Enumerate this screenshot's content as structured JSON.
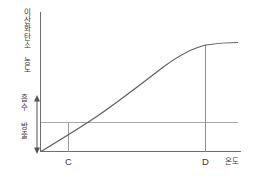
{
  "chart_data": {
    "type": "line",
    "title": "",
    "subtitle": "",
    "ylabel": "이산화탄소 농도",
    "xlabel": "온도",
    "grid": false,
    "legend": null,
    "xlim": [
      0,
      10
    ],
    "ylim": [
      0,
      10
    ],
    "x_tick_labels": [
      "C",
      "D"
    ],
    "x_tick_values": [
      1.45,
      8.4
    ],
    "y_tick_labels": [],
    "series": [
      {
        "name": "이산화탄소 농도 곡선",
        "x": [
          0.0,
          0.5,
          1.0,
          1.45,
          2.0,
          2.6,
          3.2,
          3.9,
          4.6,
          5.3,
          6.0,
          6.7,
          7.4,
          8.0,
          8.4,
          9.0,
          9.6,
          10.0
        ],
        "y": [
          0.0,
          0.72,
          1.38,
          1.95,
          2.58,
          3.22,
          3.82,
          4.48,
          5.08,
          5.63,
          6.12,
          6.57,
          6.95,
          7.2,
          7.33,
          7.42,
          7.45,
          7.46
        ]
      }
    ],
    "reference_lines": [
      {
        "name": "평형선",
        "orientation": "horizontal",
        "y": 1.95,
        "label": ""
      }
    ],
    "marker_lines": [
      {
        "name": "C 지점 수선",
        "orientation": "vertical",
        "x": 1.45,
        "y_from": 0.0,
        "y_to": 1.95
      },
      {
        "name": "D 지점 수선",
        "orientation": "vertical",
        "x": 8.4,
        "y_from": 0.0,
        "y_to": 7.33
      }
    ],
    "annotations": [
      {
        "name": "흡수 구간",
        "text": "흡수",
        "region": "above-reference-line"
      },
      {
        "name": "방출 구간",
        "text": "방출",
        "region": "below-reference-line"
      }
    ]
  },
  "labels": {
    "y_axis": "이산화탄소 농도",
    "x_axis": "온도",
    "point_c": "C",
    "point_d": "D",
    "absorb": "흡수",
    "emit": "방출"
  }
}
